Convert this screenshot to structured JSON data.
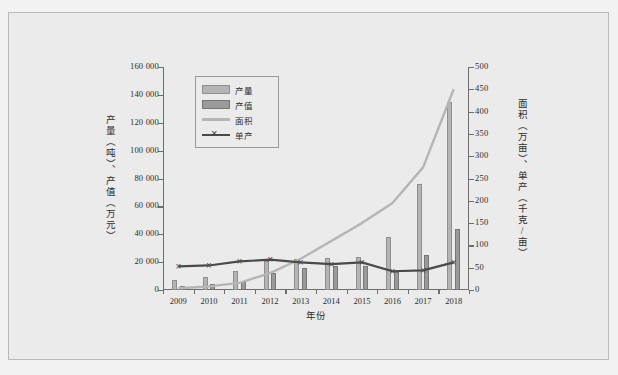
{
  "chart_data": {
    "type": "bar",
    "title": "",
    "xlabel": "年份",
    "ylabel": "产量（吨）、产值（万元）",
    "ylabel_secondary": "面积（万亩）、单产（千克/亩）",
    "categories": [
      "2009",
      "2010",
      "2011",
      "2012",
      "2013",
      "2014",
      "2015",
      "2016",
      "2017",
      "2018"
    ],
    "ylim": [
      0,
      160000
    ],
    "ylim_secondary": [
      0,
      500
    ],
    "yticks": [
      "0",
      "20 000",
      "40 000",
      "60 000",
      "80 000",
      "100 000",
      "120 000",
      "140 000",
      "160 000"
    ],
    "ytick_values": [
      0,
      20000,
      40000,
      60000,
      80000,
      100000,
      120000,
      140000,
      160000
    ],
    "yticks_secondary": [
      "0",
      "50",
      "100",
      "150",
      "200",
      "250",
      "300",
      "350",
      "400",
      "450",
      "500"
    ],
    "ytick_values_secondary": [
      0,
      50,
      100,
      150,
      200,
      250,
      300,
      350,
      400,
      450,
      500
    ],
    "grid": false,
    "legend_position": "upper left",
    "series": [
      {
        "name": "产量",
        "kind": "bar",
        "axis": "left",
        "unit": "吨",
        "color": "#b4b4b4",
        "values": [
          7000,
          9000,
          14000,
          21000,
          22000,
          23000,
          24000,
          38000,
          76000,
          135000
        ]
      },
      {
        "name": "产值",
        "kind": "bar",
        "axis": "left",
        "unit": "万元",
        "color": "#9a9a9a",
        "values": [
          3000,
          4000,
          6000,
          12000,
          16000,
          17000,
          17000,
          13000,
          25000,
          44000
        ]
      },
      {
        "name": "面积",
        "kind": "line",
        "axis": "right",
        "unit": "万亩",
        "color": "#b5b5b5",
        "values": [
          4,
          8,
          16,
          38,
          70,
          110,
          150,
          195,
          275,
          450
        ]
      },
      {
        "name": "单产",
        "kind": "line-marker",
        "axis": "right",
        "unit": "千克/亩",
        "color": "#4a4a4a",
        "marker": "×",
        "values": [
          53,
          55,
          64,
          68,
          62,
          58,
          62,
          42,
          44,
          62
        ]
      }
    ],
    "legend": [
      "产量",
      "产值",
      "面积",
      "单产"
    ],
    "colors": {
      "background": "#ebebeb",
      "page": "#f2f2f2",
      "axis": "#6e6e6e",
      "text": "#2b2b2b",
      "border": "#b9b9b9"
    }
  }
}
